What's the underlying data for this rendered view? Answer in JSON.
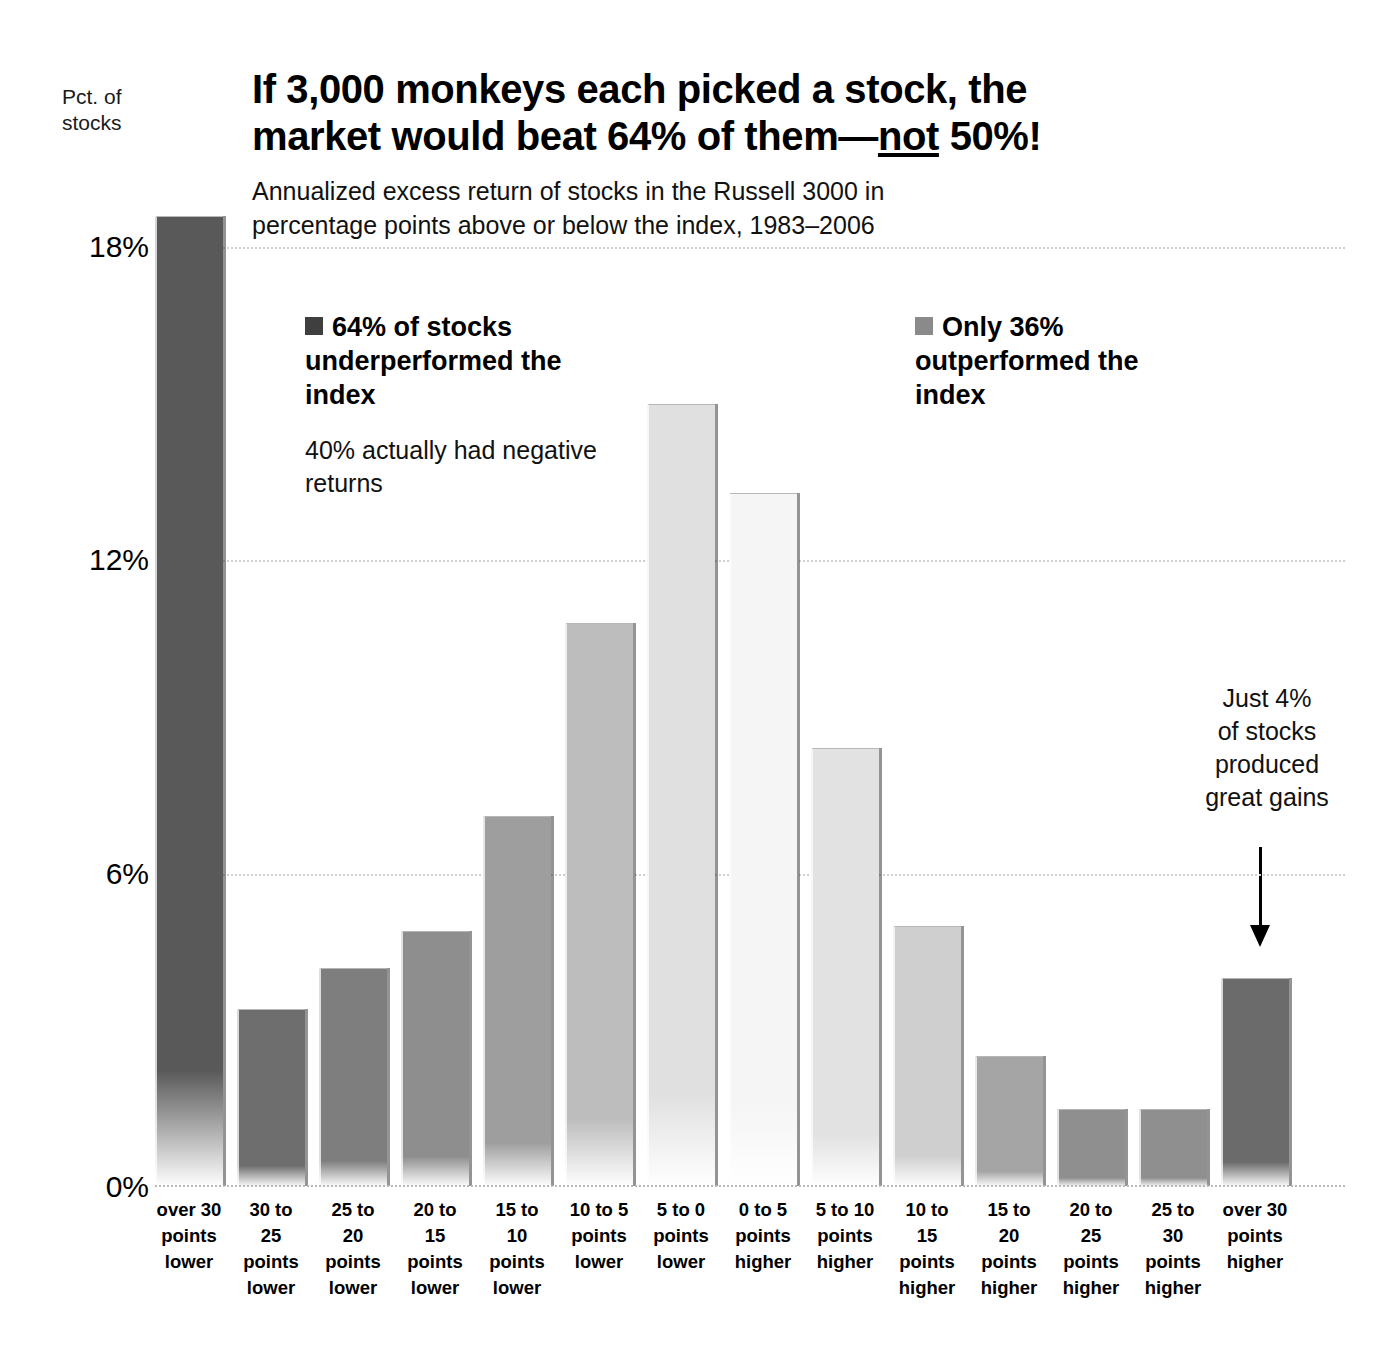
{
  "header": {
    "y_axis_caption": "Pct. of\nstocks",
    "title_part1": "If 3,000 monkeys each picked a stock, the market would beat 64% of them—",
    "title_underlined": "not",
    "title_part2": " 50%!",
    "title_full": "If 3,000 monkeys each picked a stock, the market would beat 64% of them—not 50%!",
    "subtitle": "Annualized excess return of stocks in the Russell 3000 in percentage points above or below the index, 1983–2006"
  },
  "legend": {
    "left": {
      "heading": "64% of stocks underperformed the index",
      "subnote": "40% actually had negative returns",
      "swatch_color": "#3f3f3f",
      "swatch_name": "dark-square-swatch"
    },
    "right": {
      "heading": "Only 36% outperformed the index",
      "swatch_color": "#8a8a8a",
      "swatch_name": "mid-gray-square-swatch"
    }
  },
  "callout": {
    "text": "Just 4%\nof stocks\nproduced\ngreat gains",
    "arrow_name": "down-arrow-icon"
  },
  "chart_data": {
    "type": "bar",
    "title": "If 3,000 monkeys each picked a stock, the market would beat 64% of them—not 50%!",
    "subtitle": "Annualized excess return of stocks in the Russell 3000 in percentage points above or below the index, 1983–2006",
    "xlabel": "",
    "ylabel": "Pct. of stocks",
    "ylim": [
      0,
      19
    ],
    "yticks": [
      0,
      6,
      12,
      18
    ],
    "ytick_labels": [
      "0%",
      "6%",
      "12%",
      "18%"
    ],
    "grid": true,
    "legend_position": "inside-top",
    "categories": [
      "over 30\npoints\nlower",
      "30 to 25\npoints\nlower",
      "25 to 20\npoints\nlower",
      "20 to 15\npoints\nlower",
      "15 to 10\npoints\nlower",
      "10 to 5\npoints\nlower",
      "5 to 0\npoints\nlower",
      "0 to 5\npoints\nhigher",
      "5 to 10\npoints\nhigher",
      "10 to 15\npoints\nhigher",
      "15 to 20\npoints\nhigher",
      "20 to 25\npoints\nhigher",
      "25 to 30\npoints\nhigher",
      "over 30\npoints\nhigher"
    ],
    "values": [
      18.6,
      3.4,
      4.2,
      4.9,
      7.1,
      10.8,
      15.0,
      13.3,
      8.4,
      5.0,
      2.5,
      1.5,
      1.5,
      4.0
    ],
    "bar_colors": [
      "#595959",
      "#6e6e6e",
      "#7e7e7e",
      "#8e8e8e",
      "#9e9e9e",
      "#bdbdbd",
      "#e0e0e0",
      "#f5f5f5",
      "#e2e2e2",
      "#cfcfcf",
      "#a5a5a5",
      "#8f8f8f",
      "#8f8f8f",
      "#6b6b6b"
    ],
    "annotations": [
      "64% of stocks underperformed the index",
      "40% actually had negative returns",
      "Only 36% outperformed the index",
      "Just 4% of stocks produced great gains"
    ]
  }
}
